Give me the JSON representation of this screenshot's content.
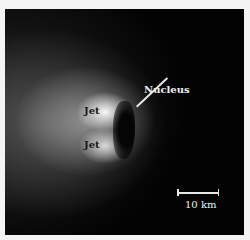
{
  "figure": {
    "labels": {
      "jet_upper": "Jet",
      "jet_lower": "Jet",
      "nucleus": "Nucleus"
    },
    "scale_bar": {
      "label": "10 km"
    },
    "colors": {
      "background": "#030303",
      "frame_border": "#f4f4f4",
      "annotation_light": "#f0f0f0",
      "annotation_dark": "#1a1a1a"
    }
  }
}
